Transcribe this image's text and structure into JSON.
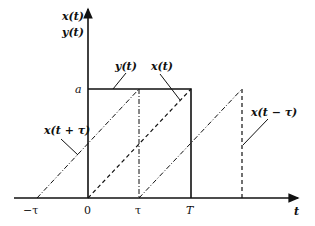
{
  "diagram": {
    "axes": {
      "y_label_line1": "x(t)",
      "y_label_line2": "y(t)",
      "x_label": "t",
      "level_label": "a"
    },
    "ticks": [
      {
        "label": "−τ",
        "value": "-tau"
      },
      {
        "label": "0",
        "value": "0"
      },
      {
        "label": "τ",
        "value": "tau"
      },
      {
        "label": "T",
        "value": "T"
      }
    ],
    "curves": [
      {
        "name": "y(t)",
        "label": "y(t)",
        "style": "solid",
        "description": "rectangular pulse of height a from 0 to T"
      },
      {
        "name": "x(t)",
        "label": "x(t)",
        "style": "dashed",
        "description": "ramp from 0 at t=0 to a at t=T"
      },
      {
        "name": "x(t+tau)",
        "label": "x(t + τ)",
        "style": "dash-dot",
        "description": "ramp shifted left by τ, from −τ to T−τ"
      },
      {
        "name": "x(t-tau)",
        "label": "x(t − τ)",
        "style": "dashed",
        "description": "ramp shifted right by τ, from τ to T+τ"
      }
    ]
  }
}
